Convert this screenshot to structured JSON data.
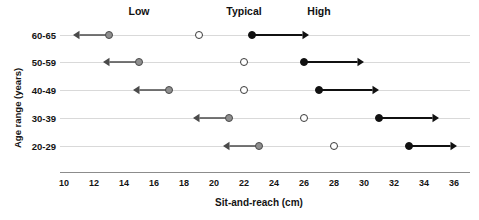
{
  "chart_data": {
    "type": "scatter",
    "title": "",
    "xlabel": "Sit-and-reach (cm)",
    "ylabel": "Age range (years)",
    "xlim": [
      10,
      36
    ],
    "xticks": [
      10,
      12,
      14,
      16,
      18,
      20,
      22,
      24,
      26,
      28,
      30,
      32,
      34,
      36
    ],
    "xtick_labels": [
      "10",
      "12",
      "14",
      "16",
      "18",
      "20",
      "22",
      "24",
      "26",
      "28",
      "30",
      "32",
      "34",
      "36"
    ],
    "grid": false,
    "legend_position": "top",
    "categories": [
      "60-65",
      "50-59",
      "40-49",
      "30-39",
      "20-29"
    ],
    "legend": [
      {
        "name": "Low",
        "marker": "gray-filled-circle",
        "arrow": "left",
        "color": "#8f8f8f",
        "x": 15
      },
      {
        "name": "Typical",
        "marker": "open-circle",
        "arrow": "none",
        "color": "#ffffff",
        "x": 22
      },
      {
        "name": "High",
        "marker": "black-filled-circle",
        "arrow": "right",
        "color": "#111111",
        "x": 27
      }
    ],
    "series": [
      {
        "name": "Low",
        "marker": "gray-filled-circle",
        "arrow_direction": "left",
        "values": [
          13,
          15,
          17,
          21,
          23
        ],
        "arrow_ends": [
          10.6,
          12.6,
          14.6,
          18.6,
          20.6
        ]
      },
      {
        "name": "Typical",
        "marker": "open-circle",
        "arrow_direction": "none",
        "values": [
          19,
          22,
          22,
          26,
          28
        ],
        "arrow_ends": [
          null,
          null,
          null,
          null,
          null
        ]
      },
      {
        "name": "High",
        "marker": "black-filled-circle",
        "arrow_direction": "right",
        "values": [
          22.5,
          26,
          27,
          31,
          33
        ],
        "arrow_ends": [
          26.3,
          30,
          31,
          35,
          36.2
        ]
      }
    ]
  }
}
